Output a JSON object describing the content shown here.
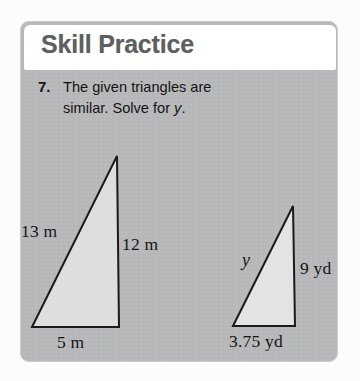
{
  "card": {
    "header_title": "Skill Practice",
    "background_color": "#b9babb",
    "header_background_color": "#ffffff",
    "header_text_color": "#5e5f60"
  },
  "problem": {
    "number": "7.",
    "line1": "The given triangles are",
    "line2_prefix": "similar. Solve for ",
    "line2_variable": "y",
    "line2_suffix": "."
  },
  "figures": [
    {
      "name": "left-triangle",
      "fill_color": "#dedede",
      "stroke_color": "#1a1a1a",
      "labels": {
        "hypotenuse": "13 m",
        "vertical": "12 m",
        "base": "5 m"
      }
    },
    {
      "name": "right-triangle",
      "fill_color": "#e3e3e3",
      "stroke_color": "#1a1a1a",
      "labels": {
        "hypotenuse": "y",
        "vertical": "9 yd",
        "base": "3.75 yd"
      }
    }
  ]
}
